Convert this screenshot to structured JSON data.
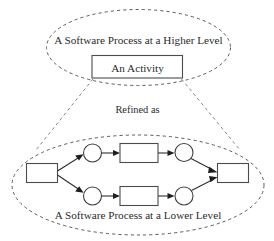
{
  "diagram": {
    "title": "A Software Process at a Higher Level",
    "type": "process-refinement-diagram",
    "colors": {
      "background": "#ffffff",
      "stroke": "#2e2e2e",
      "dashed_stroke": "#4a4a4a",
      "text": "#2b2b2b"
    },
    "upper": {
      "ellipse_label": "A Software Process at a Higher Level",
      "activity_box_label": "An Activity"
    },
    "relation": {
      "label": "Refined as"
    },
    "lower": {
      "ellipse_label": "A Software Process at a Lower Level",
      "nodes": [
        {
          "id": "start-box",
          "shape": "rectangle",
          "label": ""
        },
        {
          "id": "upper-circle-left",
          "shape": "circle",
          "label": ""
        },
        {
          "id": "upper-box",
          "shape": "rectangle",
          "label": ""
        },
        {
          "id": "upper-circle-right",
          "shape": "circle",
          "label": ""
        },
        {
          "id": "lower-circle-left",
          "shape": "circle",
          "label": ""
        },
        {
          "id": "lower-box",
          "shape": "rectangle",
          "label": ""
        },
        {
          "id": "lower-circle-right",
          "shape": "circle",
          "label": ""
        },
        {
          "id": "end-box",
          "shape": "rectangle",
          "label": ""
        }
      ],
      "edges": [
        {
          "from": "start-box",
          "to": "upper-circle-left"
        },
        {
          "from": "upper-circle-left",
          "to": "upper-box"
        },
        {
          "from": "upper-box",
          "to": "upper-circle-right"
        },
        {
          "from": "upper-circle-right",
          "to": "end-box"
        },
        {
          "from": "start-box",
          "to": "lower-circle-left"
        },
        {
          "from": "lower-circle-left",
          "to": "lower-box"
        },
        {
          "from": "lower-box",
          "to": "lower-circle-right"
        },
        {
          "from": "lower-circle-right",
          "to": "end-box"
        }
      ]
    }
  }
}
